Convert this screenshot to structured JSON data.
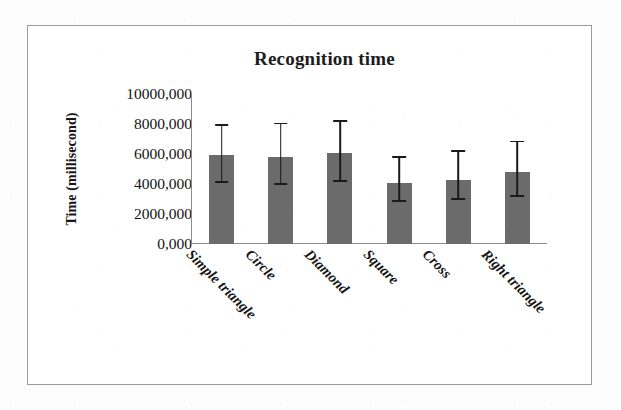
{
  "figure": {
    "title": "Recognition time",
    "y_axis_title": "Time (millisecond)",
    "border_color": "#9a9a9a",
    "bar_color": "#6b6b6b",
    "errorbar_color": "#1a1a1a",
    "background_color": "#ffffff"
  },
  "chart_data": {
    "type": "bar",
    "title": "Recognition time",
    "xlabel": "",
    "ylabel": "Time (millisecond)",
    "ylim": [
      0,
      10000
    ],
    "grid": false,
    "legend": null,
    "ytick_labels": [
      "10000,000",
      "8000,000",
      "6000,000",
      "4000,000",
      "2000,000",
      "0,000"
    ],
    "ytick_values": [
      10000,
      8000,
      6000,
      4000,
      2000,
      0
    ],
    "categories": [
      "Simple triangle",
      "Circle",
      "Diamond",
      "Square",
      "Cross",
      "Right triangle"
    ],
    "values": [
      5960,
      5830,
      6100,
      4070,
      4280,
      4810
    ],
    "error_upper": [
      7850,
      7980,
      8120,
      5760,
      6160,
      6770
    ],
    "error_lower": [
      4070,
      3940,
      4140,
      2800,
      2930,
      3130
    ],
    "series": [
      {
        "name": "Recognition time",
        "values": [
          5960,
          5830,
          6100,
          4070,
          4280,
          4810
        ]
      }
    ]
  }
}
